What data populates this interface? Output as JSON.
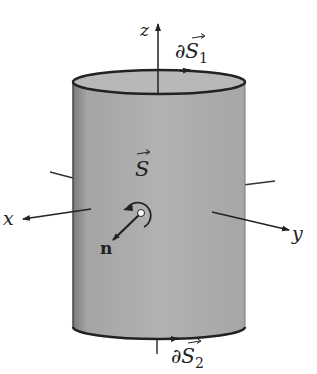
{
  "figure": {
    "labels": {
      "z_axis": "z",
      "x_axis": "x",
      "y_axis": "y",
      "surface": "S",
      "top_boundary": "∂S",
      "top_boundary_sub": "1",
      "bottom_boundary": "∂S",
      "bottom_boundary_sub": "2",
      "normal": "n"
    },
    "colors": {
      "cylinder_fill": "#a8a8a8",
      "outline": "#222222"
    }
  }
}
